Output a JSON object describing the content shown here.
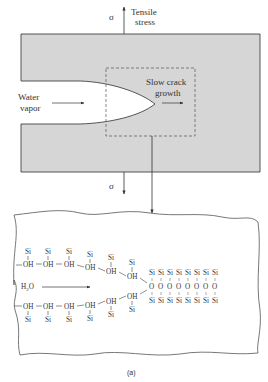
{
  "figure": {
    "caption": "(a)",
    "colors": {
      "solid": "#d6d6d6",
      "outline": "#444444",
      "text": "#333333",
      "background": "#ffffff"
    }
  },
  "top_panel": {
    "stress_symbol_top": "σ",
    "stress_label_line1": "Tensile",
    "stress_label_line2": "stress",
    "stress_symbol_bottom": "σ",
    "water_label_line1": "Water",
    "water_label_line2": "vapor",
    "crack_label_line1": "Slow crack",
    "crack_label_line2": "growth"
  },
  "bottom_panel": {
    "water_molecule": "H2O",
    "water_molecule_main": "H",
    "water_molecule_sub": "2",
    "water_molecule_end": "O",
    "upper_chain": {
      "hydroxyl": [
        "OH",
        "OH",
        "OH",
        "OH",
        "OH",
        "OH"
      ],
      "silicon": [
        "Si",
        "Si",
        "Si",
        "Si",
        "Si",
        "Si"
      ]
    },
    "lower_chain": {
      "hydroxyl": [
        "OH",
        "OH",
        "OH",
        "OH",
        "OH",
        "OH"
      ],
      "silicon": [
        "Si",
        "Si",
        "Si",
        "Si",
        "Si",
        "Si"
      ]
    },
    "bridge_oxygen_count": 8,
    "lattice": {
      "top_row": [
        "Si",
        "Si",
        "Si",
        "Si",
        "Si",
        "Si",
        "Si",
        "Si"
      ],
      "oxygen_row": [
        "O",
        "O",
        "O",
        "O",
        "O",
        "O",
        "O",
        "O"
      ],
      "bottom_row": [
        "Si",
        "Si",
        "Si",
        "Si",
        "Si",
        "Si",
        "Si",
        "Si"
      ]
    }
  }
}
